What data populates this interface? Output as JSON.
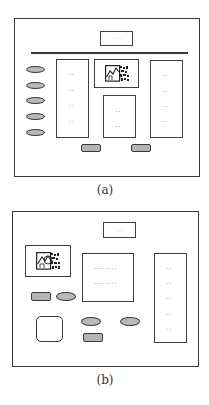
{
  "figure": {
    "panels": [
      {
        "id": "a",
        "caption": "(a)",
        "title_box_text": "----",
        "left_panel_items": [
          "--",
          "--",
          "--",
          "--"
        ],
        "middle_panel_items": [
          "--",
          "--"
        ],
        "right_panel_items": [
          "--",
          "--",
          "--",
          "--"
        ],
        "oval_buttons": 5,
        "rect_buttons": 2,
        "image_icon": "chart-thumbnail-icon"
      },
      {
        "id": "b",
        "caption": "(b)",
        "title_box_text": "---",
        "middle_panel_items": [
          "--------",
          "--------"
        ],
        "right_panel_items": [
          "--",
          "--",
          "--",
          "--",
          "--"
        ],
        "oval_buttons": 3,
        "rect_buttons": 2,
        "rounded_square": 1,
        "image_icon": "chart-thumbnail-icon"
      }
    ],
    "colors": {
      "stroke": "#3a3a3a",
      "button_fill": "#b9b9b9",
      "background": "#ffffff"
    }
  }
}
